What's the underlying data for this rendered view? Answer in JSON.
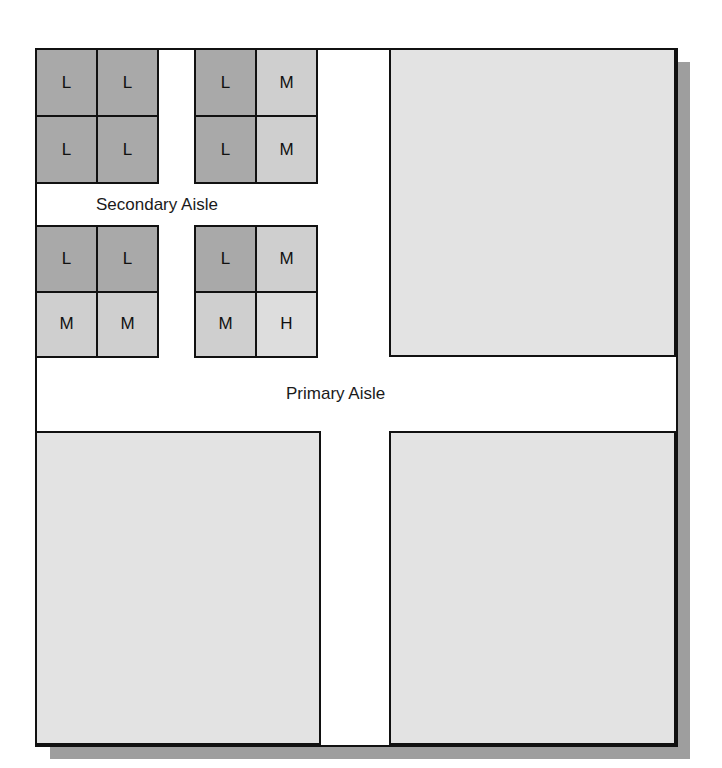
{
  "labels": {
    "secondary_aisle": "Secondary Aisle",
    "primary_aisle": "Primary Aisle"
  },
  "legend_codes": {
    "L": "L",
    "M": "M",
    "H": "H"
  },
  "colors": {
    "L": "#a9a9a9",
    "M": "#cfcfcf",
    "H": "#dddddd",
    "area": "#e3e3e3",
    "shadow": "#9e9e9e",
    "border": "#111111"
  },
  "blocks": [
    {
      "id": "top-left",
      "cells": [
        "L",
        "L",
        "L",
        "L"
      ]
    },
    {
      "id": "top-right",
      "cells": [
        "L",
        "M",
        "L",
        "M"
      ]
    },
    {
      "id": "bottom-left",
      "cells": [
        "L",
        "L",
        "M",
        "M"
      ]
    },
    {
      "id": "bottom-right",
      "cells": [
        "L",
        "M",
        "M",
        "H"
      ]
    }
  ]
}
